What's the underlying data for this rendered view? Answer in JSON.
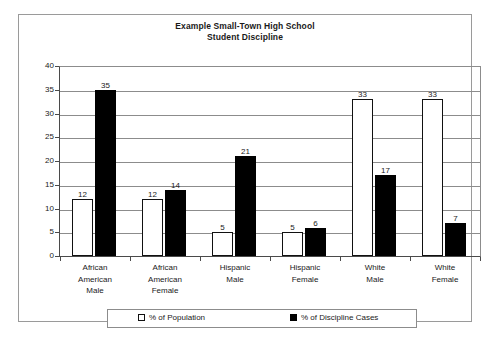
{
  "chart_data": {
    "type": "bar",
    "title": "Example Small-Town High School Student Discipline",
    "title_line1": "Example Small-Town High School",
    "title_line2": "Student Discipline",
    "xlabel": "",
    "ylabel": "",
    "ylim": [
      0,
      40
    ],
    "ytick_step": 5,
    "yticks": [
      0,
      5,
      10,
      15,
      20,
      25,
      30,
      35,
      40
    ],
    "grid": true,
    "legend_position": "bottom",
    "categories": [
      "African American Male",
      "African American Female",
      "Hispanic Male",
      "Hispanic Female",
      "White Male",
      "White Female"
    ],
    "category_lines": [
      [
        "African",
        "American",
        "Male"
      ],
      [
        "African",
        "American",
        "Female"
      ],
      [
        "Hispanic",
        "Male"
      ],
      [
        "Hispanic",
        "Female"
      ],
      [
        "White",
        "Male"
      ],
      [
        "White",
        "Female"
      ]
    ],
    "series": [
      {
        "name": "% of Population",
        "color": "#ffffff",
        "edge_color": "#000000",
        "values": [
          12,
          12,
          5,
          5,
          33,
          33
        ]
      },
      {
        "name": "% of Discipline Cases",
        "color": "#000000",
        "edge_color": "#000000",
        "values": [
          35,
          14,
          21,
          6,
          17,
          7
        ]
      }
    ]
  },
  "legend": {
    "population_label": "% of Population",
    "discipline_label": "% of Discipline Cases"
  },
  "colors": {
    "frame": "#9a9a9a",
    "gridline": "#8c8c8c",
    "axis": "#4a4a4a",
    "text": "#1a1a1a",
    "bar_population": "#ffffff",
    "bar_discipline": "#000000",
    "background": "#ffffff"
  }
}
